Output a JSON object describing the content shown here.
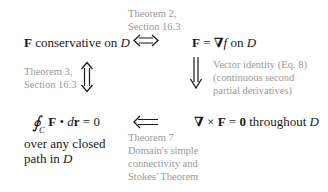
{
  "diagram": {
    "type": "equivalence-flow",
    "colors": {
      "statement": "#1a1a1a",
      "justification": "#9a9a9a",
      "arrow": "#1a1a1a",
      "background": "#ffffff"
    },
    "nodes": {
      "conservative": {
        "bold": "F",
        "text": " conservative on ",
        "italic": "D"
      },
      "gradient": {
        "bold": "F",
        "eq": " = ",
        "nabla": "∇",
        "f": "f",
        "text": " on ",
        "italic": "D"
      },
      "curl": {
        "nabla": "∇",
        "times": " × ",
        "bold": "F",
        "eq": " = ",
        "zero": "0",
        "text": " throughout ",
        "italic": "D"
      },
      "circulation": {
        "integral": "∮",
        "sub": "C",
        "bold": "F",
        "dot": " • ",
        "d": "d",
        "r": "r",
        "eq": " = 0",
        "line2": "over any closed",
        "line3_text": "path in ",
        "line3_italic": "D"
      }
    },
    "edges": [
      {
        "from": "conservative",
        "to": "gradient",
        "arrow": "double-headed horizontal (⟺)",
        "label_lines": [
          "Theorem 2,",
          "Section 16.3"
        ]
      },
      {
        "from": "gradient",
        "to": "curl",
        "arrow": "implies downward (⟱)",
        "label_lines": [
          "Vector identity (Eq. 8)",
          "(continuous second",
          "partial derivatives)"
        ]
      },
      {
        "from": "curl",
        "to": "circulation",
        "arrow": "implies leftward (⟸)",
        "label_lines": [
          "Theorem 7",
          "Domain's simple",
          "connectivity and",
          "Stokes' Theorem"
        ]
      },
      {
        "from": "conservative",
        "to": "circulation",
        "arrow": "double-headed vertical (⇕)",
        "label_lines": [
          "Theorem 3,",
          "Section 16.3"
        ]
      }
    ]
  }
}
